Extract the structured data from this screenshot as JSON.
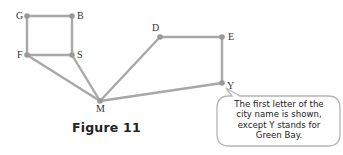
{
  "figure": {
    "caption": "Figure 11"
  },
  "graph": {
    "edge_color": "#a8a8a8",
    "node_color": "#999999",
    "nodes": [
      {
        "id": "G",
        "label": "G",
        "x": 27,
        "y": 16,
        "label_dx": -11,
        "label_dy": -5
      },
      {
        "id": "B",
        "label": "B",
        "x": 72,
        "y": 16,
        "label_dx": 5,
        "label_dy": -5
      },
      {
        "id": "F",
        "label": "F",
        "x": 27,
        "y": 55,
        "label_dx": -10,
        "label_dy": -5
      },
      {
        "id": "S",
        "label": "S",
        "x": 72,
        "y": 55,
        "label_dx": 5,
        "label_dy": -5
      },
      {
        "id": "M",
        "label": "M",
        "x": 100,
        "y": 101,
        "label_dx": -4,
        "label_dy": 3
      },
      {
        "id": "D",
        "label": "D",
        "x": 160,
        "y": 37,
        "label_dx": -8,
        "label_dy": -14
      },
      {
        "id": "E",
        "label": "E",
        "x": 222,
        "y": 37,
        "label_dx": 6,
        "label_dy": -5
      },
      {
        "id": "Y",
        "label": "Y",
        "x": 222,
        "y": 83,
        "label_dx": 5,
        "label_dy": -2
      }
    ],
    "edges": [
      [
        "G",
        "B"
      ],
      [
        "G",
        "F"
      ],
      [
        "B",
        "S"
      ],
      [
        "F",
        "S"
      ],
      [
        "F",
        "M"
      ],
      [
        "S",
        "M"
      ],
      [
        "M",
        "D"
      ],
      [
        "M",
        "Y"
      ],
      [
        "D",
        "E"
      ],
      [
        "E",
        "Y"
      ]
    ]
  },
  "callout": {
    "lines": [
      "The first letter of the",
      "city name is shown,",
      "except Y stands for",
      "Green Bay."
    ],
    "border_color": "#b5b5b5",
    "fill_color": "#ffffff"
  }
}
